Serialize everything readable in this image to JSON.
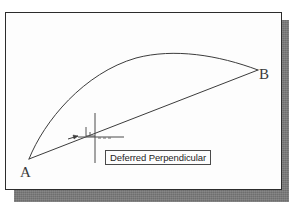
{
  "app": {
    "context": "cad-drawing-canvas",
    "background_color": "#ffffff"
  },
  "panel": {
    "name": "drawing-area",
    "fill_color": "#fdfdfd",
    "border_color": "#2c2c2c",
    "shadow_color": "#6e6e6e"
  },
  "drawing": {
    "stroke_color": "#3c3c3c",
    "entities": [
      {
        "kind": "arc",
        "name": "arc-a-to-b",
        "start_point": "A",
        "end_point": "B",
        "path": "M 23,146 C 38,108 78,60 130,45 C 168,35 212,42 252,57"
      },
      {
        "kind": "line",
        "name": "chord-a-to-b",
        "start_point": "A",
        "end_point": "B",
        "path": "M 23,146 L 252,57"
      }
    ],
    "points": [
      {
        "label": "A",
        "x": 23,
        "y": 146
      },
      {
        "label": "B",
        "x": 252,
        "y": 57
      }
    ]
  },
  "cursor": {
    "name": "crosshair-cursor",
    "center_x": 89,
    "center_y": 124,
    "vertical_top": 100,
    "vertical_bottom": 150,
    "horizontal_left": 72,
    "horizontal_right": 118,
    "stroke_color": "#4a4a4a"
  },
  "snap_marker": {
    "name": "perpendicular-osnap-marker",
    "glyph": "perpendicular",
    "x": 80,
    "y": 114,
    "size": 9,
    "stroke_color": "#555555"
  },
  "tooltip": {
    "text": "Deferred Perpendicular",
    "border_color": "#4a4a4a",
    "background_color": "#fdfdfd",
    "text_color": "#1d1d1d"
  },
  "labels": {
    "point_a": "A",
    "point_b": "B"
  }
}
